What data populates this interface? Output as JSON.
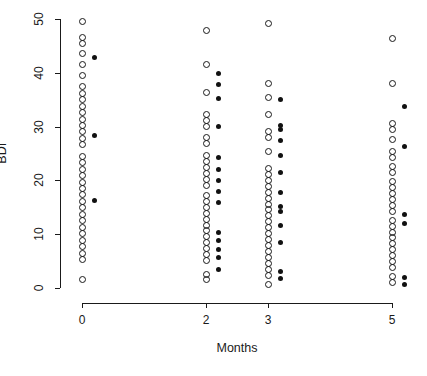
{
  "chart_data": {
    "type": "scatter",
    "title": "",
    "xlabel": "Months",
    "ylabel": "BDI",
    "xlim": [
      -0.45,
      5.6
    ],
    "ylim": [
      0,
      50
    ],
    "grid": false,
    "legend": null,
    "x_categories": [
      "0",
      "2",
      "3",
      "5"
    ],
    "x_tick_values": [
      0,
      2,
      3,
      5
    ],
    "y_tick_values": [
      0,
      10,
      20,
      30,
      40,
      50
    ],
    "marker_styles": {
      "open_circle": "unfilled circle marker",
      "filled_circle": "solid black dot marker"
    },
    "series": [
      {
        "name": "open_circle",
        "marker": "open_circle",
        "points": [
          {
            "x": 0,
            "y": 49.5
          },
          {
            "x": 0,
            "y": 46.5
          },
          {
            "x": 0,
            "y": 45.5
          },
          {
            "x": 0,
            "y": 43.5
          },
          {
            "x": 0,
            "y": 41.5
          },
          {
            "x": 0,
            "y": 39.5
          },
          {
            "x": 0,
            "y": 37.5
          },
          {
            "x": 0,
            "y": 36.2
          },
          {
            "x": 0,
            "y": 35.0
          },
          {
            "x": 0,
            "y": 33.8
          },
          {
            "x": 0,
            "y": 32.6
          },
          {
            "x": 0,
            "y": 31.4
          },
          {
            "x": 0,
            "y": 30.2
          },
          {
            "x": 0,
            "y": 29.0
          },
          {
            "x": 0,
            "y": 27.8
          },
          {
            "x": 0,
            "y": 26.6
          },
          {
            "x": 0,
            "y": 24.5
          },
          {
            "x": 0,
            "y": 23.3
          },
          {
            "x": 0,
            "y": 22.1
          },
          {
            "x": 0,
            "y": 20.9
          },
          {
            "x": 0,
            "y": 19.7
          },
          {
            "x": 0,
            "y": 18.5
          },
          {
            "x": 0,
            "y": 17.3
          },
          {
            "x": 0,
            "y": 16.1
          },
          {
            "x": 0,
            "y": 14.9
          },
          {
            "x": 0,
            "y": 13.7
          },
          {
            "x": 0,
            "y": 12.5
          },
          {
            "x": 0,
            "y": 11.3
          },
          {
            "x": 0,
            "y": 10.1
          },
          {
            "x": 0,
            "y": 8.9
          },
          {
            "x": 0,
            "y": 7.7
          },
          {
            "x": 0,
            "y": 6.5
          },
          {
            "x": 0,
            "y": 5.3
          },
          {
            "x": 0,
            "y": 1.6
          },
          {
            "x": 2,
            "y": 47.8
          },
          {
            "x": 2,
            "y": 41.5
          },
          {
            "x": 2,
            "y": 36.4
          },
          {
            "x": 2,
            "y": 32.2
          },
          {
            "x": 2,
            "y": 31.1
          },
          {
            "x": 2,
            "y": 30.0
          },
          {
            "x": 2,
            "y": 28.0
          },
          {
            "x": 2,
            "y": 26.9
          },
          {
            "x": 2,
            "y": 24.6
          },
          {
            "x": 2,
            "y": 23.5
          },
          {
            "x": 2,
            "y": 22.4
          },
          {
            "x": 2,
            "y": 21.3
          },
          {
            "x": 2,
            "y": 20.2
          },
          {
            "x": 2,
            "y": 19.1
          },
          {
            "x": 2,
            "y": 17.2
          },
          {
            "x": 2,
            "y": 16.1
          },
          {
            "x": 2,
            "y": 15.0
          },
          {
            "x": 2,
            "y": 13.9
          },
          {
            "x": 2,
            "y": 12.8
          },
          {
            "x": 2,
            "y": 11.7
          },
          {
            "x": 2,
            "y": 10.6
          },
          {
            "x": 2,
            "y": 9.5
          },
          {
            "x": 2,
            "y": 8.4
          },
          {
            "x": 2,
            "y": 7.3
          },
          {
            "x": 2,
            "y": 6.2
          },
          {
            "x": 2,
            "y": 5.1
          },
          {
            "x": 2,
            "y": 2.6
          },
          {
            "x": 2,
            "y": 1.5
          },
          {
            "x": 3,
            "y": 49.2
          },
          {
            "x": 3,
            "y": 38.0
          },
          {
            "x": 3,
            "y": 35.4
          },
          {
            "x": 3,
            "y": 32.3
          },
          {
            "x": 3,
            "y": 29.0
          },
          {
            "x": 3,
            "y": 27.9
          },
          {
            "x": 3,
            "y": 25.4
          },
          {
            "x": 3,
            "y": 22.2
          },
          {
            "x": 3,
            "y": 21.1
          },
          {
            "x": 3,
            "y": 20.0
          },
          {
            "x": 3,
            "y": 18.9
          },
          {
            "x": 3,
            "y": 17.8
          },
          {
            "x": 3,
            "y": 16.7
          },
          {
            "x": 3,
            "y": 15.6
          },
          {
            "x": 3,
            "y": 14.5
          },
          {
            "x": 3,
            "y": 13.4
          },
          {
            "x": 3,
            "y": 12.3
          },
          {
            "x": 3,
            "y": 11.2
          },
          {
            "x": 3,
            "y": 10.1
          },
          {
            "x": 3,
            "y": 9.0
          },
          {
            "x": 3,
            "y": 7.9
          },
          {
            "x": 3,
            "y": 6.8
          },
          {
            "x": 3,
            "y": 5.7
          },
          {
            "x": 3,
            "y": 4.6
          },
          {
            "x": 3,
            "y": 3.5
          },
          {
            "x": 3,
            "y": 2.4
          },
          {
            "x": 3,
            "y": 0.6
          },
          {
            "x": 5,
            "y": 46.3
          },
          {
            "x": 5,
            "y": 38.0
          },
          {
            "x": 5,
            "y": 30.5
          },
          {
            "x": 5,
            "y": 29.4
          },
          {
            "x": 5,
            "y": 27.6
          },
          {
            "x": 5,
            "y": 25.4
          },
          {
            "x": 5,
            "y": 24.3
          },
          {
            "x": 5,
            "y": 22.6
          },
          {
            "x": 5,
            "y": 21.5
          },
          {
            "x": 5,
            "y": 19.8
          },
          {
            "x": 5,
            "y": 18.7
          },
          {
            "x": 5,
            "y": 17.6
          },
          {
            "x": 5,
            "y": 16.5
          },
          {
            "x": 5,
            "y": 15.4
          },
          {
            "x": 5,
            "y": 14.3
          },
          {
            "x": 5,
            "y": 12.6
          },
          {
            "x": 5,
            "y": 11.5
          },
          {
            "x": 5,
            "y": 10.4
          },
          {
            "x": 5,
            "y": 9.3
          },
          {
            "x": 5,
            "y": 8.2
          },
          {
            "x": 5,
            "y": 7.1
          },
          {
            "x": 5,
            "y": 6.0
          },
          {
            "x": 5,
            "y": 4.9
          },
          {
            "x": 5,
            "y": 3.8
          },
          {
            "x": 5,
            "y": 2.1
          },
          {
            "x": 5,
            "y": 1.0
          }
        ]
      },
      {
        "name": "filled_circle",
        "marker": "filled_circle",
        "points": [
          {
            "x": 0,
            "y": 42.8
          },
          {
            "x": 0,
            "y": 28.3
          },
          {
            "x": 0,
            "y": 16.2
          },
          {
            "x": 2,
            "y": 39.8
          },
          {
            "x": 2,
            "y": 37.8
          },
          {
            "x": 2,
            "y": 35.2
          },
          {
            "x": 2,
            "y": 30.0
          },
          {
            "x": 2,
            "y": 24.3
          },
          {
            "x": 2,
            "y": 22.1
          },
          {
            "x": 2,
            "y": 20.0
          },
          {
            "x": 2,
            "y": 18.0
          },
          {
            "x": 2,
            "y": 15.8
          },
          {
            "x": 2,
            "y": 10.4
          },
          {
            "x": 2,
            "y": 8.8
          },
          {
            "x": 2,
            "y": 7.2
          },
          {
            "x": 2,
            "y": 5.6
          },
          {
            "x": 2,
            "y": 3.4
          },
          {
            "x": 3,
            "y": 35.0
          },
          {
            "x": 3,
            "y": 30.2
          },
          {
            "x": 3,
            "y": 29.4
          },
          {
            "x": 3,
            "y": 27.5
          },
          {
            "x": 3,
            "y": 24.7
          },
          {
            "x": 3,
            "y": 21.5
          },
          {
            "x": 3,
            "y": 17.8
          },
          {
            "x": 3,
            "y": 15.2
          },
          {
            "x": 3,
            "y": 14.2
          },
          {
            "x": 3,
            "y": 11.6
          },
          {
            "x": 3,
            "y": 8.5
          },
          {
            "x": 3,
            "y": 3.0
          },
          {
            "x": 3,
            "y": 1.8
          },
          {
            "x": 5,
            "y": 33.8
          },
          {
            "x": 5,
            "y": 26.3
          },
          {
            "x": 5,
            "y": 13.6
          },
          {
            "x": 5,
            "y": 11.9
          },
          {
            "x": 5,
            "y": 1.9
          },
          {
            "x": 5,
            "y": 0.7
          }
        ]
      }
    ]
  }
}
